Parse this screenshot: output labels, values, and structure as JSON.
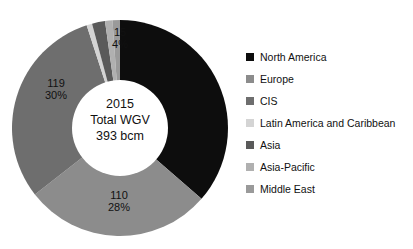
{
  "chart_data": {
    "type": "pie",
    "variant": "donut",
    "title": "",
    "center_label": {
      "line1": "2015",
      "line2": "Total WGV",
      "line3": "393 bcm"
    },
    "unit": "bcm",
    "total": 393,
    "categories": [
      "North America",
      "Europe",
      "CIS",
      "Latin America and Caribbean",
      "Asia",
      "Asia-Pacific",
      "Middle East"
    ],
    "values": [
      143,
      110,
      119,
      2,
      15,
      3,
      1
    ],
    "percents": [
      36,
      28,
      30,
      1,
      4,
      1,
      0
    ],
    "colors": [
      "#0d0d0d",
      "#8c8c8c",
      "#6e6e6e",
      "#d4d4d4",
      "#5a5a5a",
      "#b0b0b0",
      "#9a9a9a"
    ],
    "legend_position": "right",
    "grid": false,
    "start_angle_deg": 0,
    "direction": "clockwise",
    "data_labels": [
      {
        "value": "119",
        "percent": "30%",
        "category": "CIS"
      },
      {
        "value": "110",
        "percent": "28%",
        "category": "Europe"
      },
      {
        "value": "15",
        "percent": "4%",
        "category": "Asia"
      }
    ],
    "slices": [
      {
        "name": "North America",
        "value": 143,
        "percent": 36,
        "color": "#0d0d0d",
        "start_deg": 0,
        "end_deg": 131,
        "labeled": false
      },
      {
        "name": "Europe",
        "value": 110,
        "percent": 28,
        "color": "#8c8c8c",
        "start_deg": 131,
        "end_deg": 232,
        "labeled": true
      },
      {
        "name": "CIS",
        "value": 119,
        "percent": 30,
        "color": "#6e6e6e",
        "start_deg": 232,
        "end_deg": 342,
        "labeled": true
      },
      {
        "name": "Latin America and Caribbean",
        "value": 2,
        "percent": 1,
        "color": "#d4d4d4",
        "start_deg": 342,
        "end_deg": 345,
        "labeled": false
      },
      {
        "name": "Asia",
        "value": 15,
        "percent": 4,
        "color": "#5a5a5a",
        "start_deg": 345,
        "end_deg": 352,
        "labeled": true
      },
      {
        "name": "Asia-Pacific",
        "value": 3,
        "percent": 1,
        "color": "#b0b0b0",
        "start_deg": 352,
        "end_deg": 356,
        "labeled": false
      },
      {
        "name": "Middle East",
        "value": 1,
        "percent": 0,
        "color": "#9a9a9a",
        "start_deg": 356,
        "end_deg": 360,
        "labeled": false
      }
    ]
  },
  "legend": {
    "items": [
      {
        "label": "North America",
        "color": "#0d0d0d"
      },
      {
        "label": "Europe",
        "color": "#8c8c8c"
      },
      {
        "label": "CIS",
        "color": "#6e6e6e"
      },
      {
        "label": "Latin America and Caribbean",
        "color": "#d4d4d4"
      },
      {
        "label": "Asia",
        "color": "#5a5a5a"
      },
      {
        "label": "Asia-Pacific",
        "color": "#b0b0b0"
      },
      {
        "label": "Middle East",
        "color": "#9a9a9a"
      }
    ]
  }
}
